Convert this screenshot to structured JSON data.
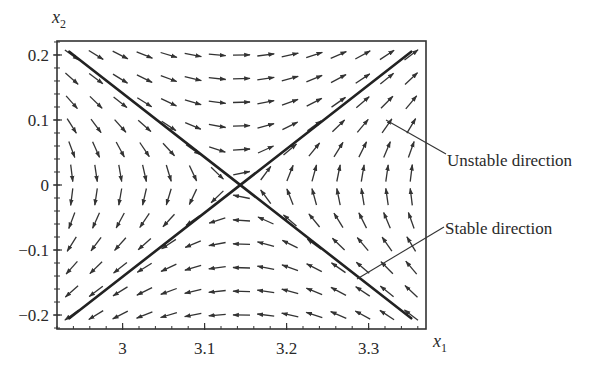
{
  "chart_data": {
    "type": "quiver",
    "title": "",
    "xlabel": "x1",
    "ylabel": "x2",
    "xlim": [
      2.92,
      3.37
    ],
    "ylim": [
      -0.2215,
      0.2215
    ],
    "x_ticks": [
      3.0,
      3.1,
      3.2,
      3.3
    ],
    "x_tick_labels": [
      "3",
      "3.1",
      "3.2",
      "3.3"
    ],
    "x_minor_step": 0.02,
    "y_ticks": [
      0.2,
      0.1,
      0.0,
      -0.1,
      -0.2
    ],
    "y_tick_labels": [
      "0.2",
      "0.1",
      "0",
      "−0.1",
      "−0.2"
    ],
    "y_minor_step": 0.02,
    "grid": false,
    "equilibrium": {
      "x1": 3.14,
      "x2": 0.0,
      "type": "saddle"
    },
    "field": {
      "form": "x1' = x2, x2' = k*(x1 - x1_eq)",
      "k": 0.9,
      "grid_cols": 15,
      "grid_rows": 12,
      "x_range": [
        2.938,
        3.352
      ],
      "y_range": [
        0.2,
        -0.2
      ]
    },
    "separatrices": [
      {
        "name": "stable",
        "label": "Stable direction",
        "from": [
          2.935,
          0.205
        ],
        "to": [
          3.352,
          -0.205
        ]
      },
      {
        "name": "unstable",
        "label": "Unstable direction",
        "from": [
          2.935,
          -0.205
        ],
        "to": [
          3.352,
          0.205
        ]
      }
    ],
    "annotations": [
      {
        "text": "Unstable direction",
        "points_to": "unstable separatrix"
      },
      {
        "text": "Stable direction",
        "points_to": "stable separatrix"
      }
    ]
  },
  "axes": {
    "x_label_main": "x",
    "x_label_sub": "1",
    "y_label_main": "x",
    "y_label_sub": "2"
  },
  "labels": {
    "unstable": "Unstable direction",
    "stable": "Stable direction"
  }
}
